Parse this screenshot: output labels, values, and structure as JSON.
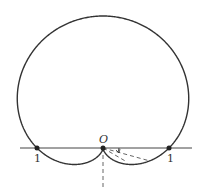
{
  "diagram": {
    "type": "polar-curve",
    "curve": "cardioid r = 1 + sin θ",
    "labels": {
      "origin": "O",
      "left_point": "1",
      "right_point": "1"
    },
    "colors": {
      "stroke": "#333333",
      "background": "#ffffff"
    },
    "geometry": {
      "origin_px": [
        103,
        148
      ],
      "unit_px": 66
    }
  }
}
